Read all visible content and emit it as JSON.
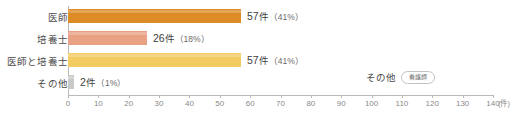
{
  "chart_data": {
    "type": "bar",
    "orientation": "horizontal",
    "title": "",
    "xlabel": "(件)",
    "ylabel": "",
    "xlim": [
      0,
      140
    ],
    "grid": false,
    "legend": "none",
    "categories": [
      "医師",
      "培養士",
      "医師と培養士",
      "その他"
    ],
    "values": [
      57,
      26,
      57,
      2
    ],
    "percents": [
      "41%",
      "18%",
      "41%",
      "1%"
    ],
    "value_labels": [
      "57 件（41%）",
      "26 件（18%）",
      "57 件（41%）",
      "2 件（1%）"
    ],
    "unit": "件",
    "colors": [
      "#dd8b26",
      "#e8a182",
      "#f2cb62",
      "#c9c9c9"
    ],
    "xticks": [
      0,
      10,
      20,
      30,
      40,
      50,
      60,
      70,
      80,
      90,
      100,
      110,
      120,
      130,
      140
    ],
    "xtick_labels": [
      "0",
      "10",
      "20",
      "30",
      "40",
      "50",
      "60",
      "70",
      "80",
      "90",
      "100",
      "110",
      "120",
      "130",
      "140"
    ],
    "bars": [
      {
        "category": "医師",
        "value": 57,
        "count": "57",
        "unit": "件",
        "percent": "（41%）",
        "color": "#dd8b26"
      },
      {
        "category": "培養士",
        "value": 26,
        "count": "26",
        "unit": "件",
        "percent": "（18%）",
        "color": "#e8a182"
      },
      {
        "category": "医師と培養士",
        "value": 57,
        "count": "57",
        "unit": "件",
        "percent": "（41%）",
        "color": "#f2cb62"
      },
      {
        "category": "その他",
        "value": 2,
        "count": "2",
        "unit": "件",
        "percent": "（1%）",
        "color": "#c9c9c9"
      }
    ],
    "annotation": {
      "label": "その他",
      "badge": "看護師"
    }
  }
}
